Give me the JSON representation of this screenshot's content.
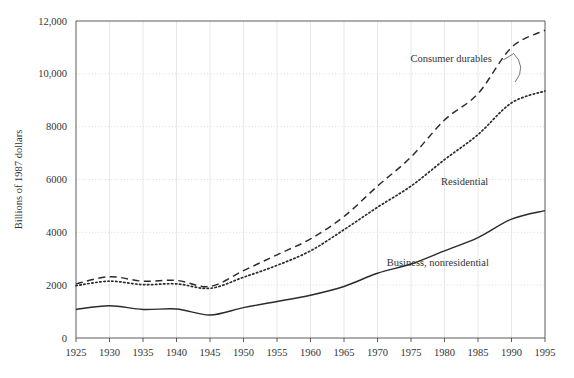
{
  "chart_data": {
    "type": "line",
    "title": "",
    "xlabel": "",
    "ylabel": "Billions of 1987 dollars",
    "xlim": [
      1925,
      1995
    ],
    "ylim": [
      0,
      12000
    ],
    "grid": true,
    "legend_position": "inline-annotations",
    "xticks": [
      1925,
      1930,
      1935,
      1940,
      1945,
      1950,
      1955,
      1960,
      1965,
      1970,
      1975,
      1980,
      1985,
      1990,
      1995
    ],
    "xtick_labels": [
      "1925",
      "1930",
      "1935",
      "1940",
      "1945",
      "1950",
      "1955",
      "1960",
      "1965",
      "1970",
      "1975",
      "1980",
      "1985",
      "1990",
      "1995"
    ],
    "yticks": [
      0,
      2000,
      4000,
      6000,
      8000,
      10000,
      12000
    ],
    "ytick_labels": [
      "0",
      "2000",
      "4000",
      "6000",
      "8000",
      "10,000",
      "12,000"
    ],
    "x": [
      1925,
      1930,
      1935,
      1940,
      1945,
      1950,
      1955,
      1960,
      1965,
      1970,
      1975,
      1980,
      1985,
      1990,
      1995
    ],
    "series": [
      {
        "name": "Consumer durables",
        "style": "dashed",
        "color": "#2b2b2b",
        "values": [
          2050,
          2320,
          2150,
          2180,
          1950,
          2550,
          3150,
          3750,
          4600,
          5750,
          6850,
          8250,
          9250,
          11000,
          11650
        ]
      },
      {
        "name": "Residential",
        "style": "dotted",
        "color": "#2b2b2b",
        "values": [
          1980,
          2150,
          2020,
          2050,
          1880,
          2300,
          2750,
          3300,
          4100,
          4950,
          5750,
          6750,
          7700,
          8900,
          9350
        ]
      },
      {
        "name": "Business, nonresidential",
        "style": "solid",
        "color": "#2b2b2b",
        "values": [
          1080,
          1220,
          1080,
          1100,
          870,
          1150,
          1380,
          1620,
          1950,
          2450,
          2800,
          3300,
          3800,
          4500,
          4820
        ]
      }
    ],
    "annotations": [
      {
        "text": "Consumer durables",
        "series": "Consumer durables",
        "x": 1981,
        "y": 10450,
        "has_leader": true
      },
      {
        "text": "Residential",
        "series": "Residential",
        "x": 1983,
        "y": 5800,
        "has_leader": false
      },
      {
        "text": "Business, nonresidential",
        "series": "Business, nonresidential",
        "x": 1979,
        "y": 2720,
        "has_leader": false
      }
    ]
  }
}
